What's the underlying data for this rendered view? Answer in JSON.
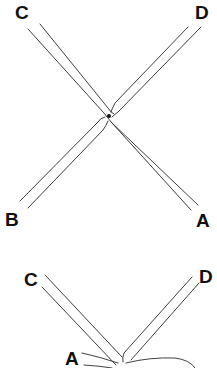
{
  "figures": [
    {
      "name": "crossing-strands-top",
      "labels": {
        "C": "C",
        "D": "D",
        "B": "B",
        "A": "A"
      }
    },
    {
      "name": "crossing-strands-bottom",
      "labels": {
        "C": "C",
        "D": "D",
        "A": "A"
      }
    }
  ],
  "colors": {
    "line": "#2a2a2a",
    "background": "#ffffff",
    "text": "#111111"
  }
}
